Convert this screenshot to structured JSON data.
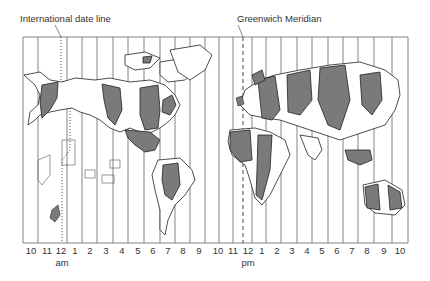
{
  "labels": {
    "date_line": "International date line",
    "greenwich": "Greenwich Meridian"
  },
  "hours": [
    "10",
    "11",
    "12",
    "1",
    "2",
    "3",
    "4",
    "5",
    "6",
    "7",
    "8",
    "9",
    "10",
    "11",
    "12",
    "1",
    "2",
    "3",
    "4",
    "5",
    "6",
    "7",
    "8",
    "9",
    "10"
  ],
  "am_label": "am",
  "pm_label": "pm",
  "colors": {
    "land_fill": "#ffffff",
    "shaded_fill": "#7a7a7a",
    "lines": "#555555"
  }
}
